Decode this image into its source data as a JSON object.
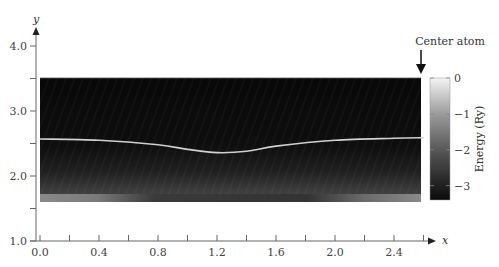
{
  "chart_data": {
    "type": "heatmap",
    "title": "",
    "xlabel": "x",
    "ylabel": "y",
    "xlim": [
      0.0,
      2.6
    ],
    "ylim": [
      1.0,
      4.3
    ],
    "x_ticks": [
      "0.0",
      "0.4",
      "0.8",
      "1.2",
      "1.6",
      "2.0",
      "2.4"
    ],
    "y_ticks": [
      "4.0",
      "3.0",
      "2.0",
      "1.0"
    ],
    "heatmap_extent": {
      "x": [
        0.0,
        2.6
      ],
      "y": [
        1.6,
        3.5
      ]
    },
    "colorbar": {
      "label": "Energy (Ry)",
      "ticks": [
        "0",
        "−1",
        "−2",
        "−3"
      ],
      "range": [
        -3.4,
        0
      ],
      "colors": [
        "#0a0a0a",
        "#f2f2f2"
      ]
    },
    "curve": {
      "name": "path",
      "x": [
        0.0,
        0.4,
        0.8,
        1.0,
        1.2,
        1.4,
        1.6,
        2.0,
        2.4,
        2.6
      ],
      "y": [
        2.57,
        2.55,
        2.48,
        2.41,
        2.36,
        2.38,
        2.46,
        2.55,
        2.58,
        2.59
      ]
    },
    "annotations": [
      {
        "text": "Center atom",
        "x": 2.6,
        "y": 3.5,
        "arrow": "down"
      }
    ]
  }
}
